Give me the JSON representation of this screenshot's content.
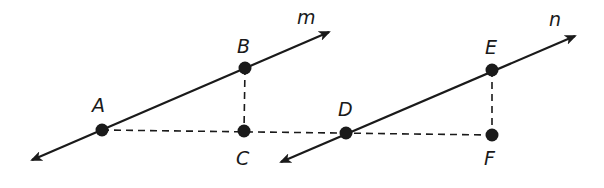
{
  "diagram": {
    "colors": {
      "stroke": "#1a1a1a",
      "background": "#ffffff"
    },
    "lines": [
      {
        "name": "m",
        "label": "m",
        "from": [
          32,
          160
        ],
        "to": [
          329,
          32
        ],
        "label_pos": [
          297,
          24
        ]
      },
      {
        "name": "n",
        "label": "n",
        "from": [
          281,
          162
        ],
        "to": [
          575,
          36
        ],
        "label_pos": [
          549,
          26
        ]
      }
    ],
    "points": [
      {
        "id": "A",
        "label": "A",
        "x": 102,
        "y": 130,
        "label_x": 92,
        "label_y": 112
      },
      {
        "id": "B",
        "label": "B",
        "x": 245,
        "y": 68,
        "label_x": 237,
        "label_y": 53
      },
      {
        "id": "C",
        "label": "C",
        "x": 244,
        "y": 131,
        "label_x": 236,
        "label_y": 165
      },
      {
        "id": "D",
        "label": "D",
        "x": 346,
        "y": 133,
        "label_x": 338,
        "label_y": 116
      },
      {
        "id": "E",
        "label": "E",
        "x": 492,
        "y": 70,
        "label_x": 485,
        "label_y": 54
      },
      {
        "id": "F",
        "label": "F",
        "x": 492,
        "y": 135,
        "label_x": 484,
        "label_y": 165
      }
    ],
    "dashed_segments": [
      {
        "name": "segment-ac-df",
        "from": "A",
        "to": "F"
      },
      {
        "name": "segment-bc",
        "from": "B",
        "to": "C"
      },
      {
        "name": "segment-ef",
        "from": "E",
        "to": "F"
      }
    ]
  }
}
